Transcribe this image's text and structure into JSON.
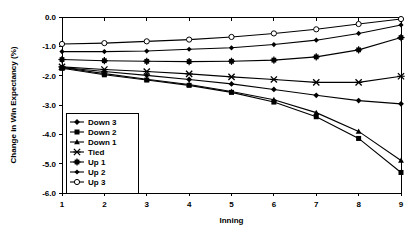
{
  "chart_data": {
    "type": "line",
    "title": "",
    "xlabel": "Inning",
    "ylabel": "Change in Win Expectancy (%)",
    "x": [
      1,
      2,
      3,
      4,
      5,
      6,
      7,
      8,
      9
    ],
    "xticklabels": [
      "1",
      "2",
      "3",
      "4",
      "5",
      "6",
      "7",
      "8",
      "9"
    ],
    "yticklabels": [
      "0.0",
      "-1.0",
      "-2.0",
      "-3.0",
      "-4.0",
      "-5.0",
      "-6.0"
    ],
    "yticks": [
      0.0,
      -1.0,
      -2.0,
      -3.0,
      -4.0,
      -5.0,
      -6.0
    ],
    "xlim": [
      1,
      9
    ],
    "ylim": [
      -6.0,
      0.0
    ],
    "grid": false,
    "legend_position": "lower left inside axes",
    "series": [
      {
        "name": "Down 3",
        "marker": "diamond-filled",
        "values": [
          -1.72,
          -1.86,
          -1.99,
          -2.13,
          -2.28,
          -2.47,
          -2.67,
          -2.85,
          -2.96
        ]
      },
      {
        "name": "Down 2",
        "marker": "square-filled",
        "values": [
          -1.75,
          -1.97,
          -2.15,
          -2.33,
          -2.57,
          -2.9,
          -3.4,
          -4.14,
          -5.3
        ]
      },
      {
        "name": "Down 1",
        "marker": "triangle-filled",
        "values": [
          -1.72,
          -1.93,
          -2.12,
          -2.3,
          -2.54,
          -2.82,
          -3.26,
          -3.9,
          -4.89
        ]
      },
      {
        "name": "Tied",
        "marker": "cross-x",
        "values": [
          -1.7,
          -1.79,
          -1.86,
          -1.94,
          -2.04,
          -2.13,
          -2.23,
          -2.23,
          -2.02
        ]
      },
      {
        "name": "Up 1",
        "marker": "star-asterisk",
        "values": [
          -1.45,
          -1.49,
          -1.51,
          -1.52,
          -1.51,
          -1.47,
          -1.36,
          -1.12,
          -0.7
        ]
      },
      {
        "name": "Up 2",
        "marker": "diamond-filled-small",
        "values": [
          -1.18,
          -1.18,
          -1.16,
          -1.1,
          -1.05,
          -0.94,
          -0.79,
          -0.56,
          -0.27
        ]
      },
      {
        "name": "Up 3",
        "marker": "circle-open",
        "values": [
          -0.92,
          -0.89,
          -0.83,
          -0.77,
          -0.68,
          -0.56,
          -0.42,
          -0.24,
          -0.07
        ]
      }
    ]
  },
  "legend": {
    "items": [
      {
        "label": "Down 3"
      },
      {
        "label": "Down 2"
      },
      {
        "label": "Down 1"
      },
      {
        "label": "Tied"
      },
      {
        "label": "Up 1"
      },
      {
        "label": "Up 2"
      },
      {
        "label": "Up 3"
      }
    ]
  },
  "colors": {
    "axis": "#000000",
    "background": "#ffffff",
    "series": "#000000"
  }
}
